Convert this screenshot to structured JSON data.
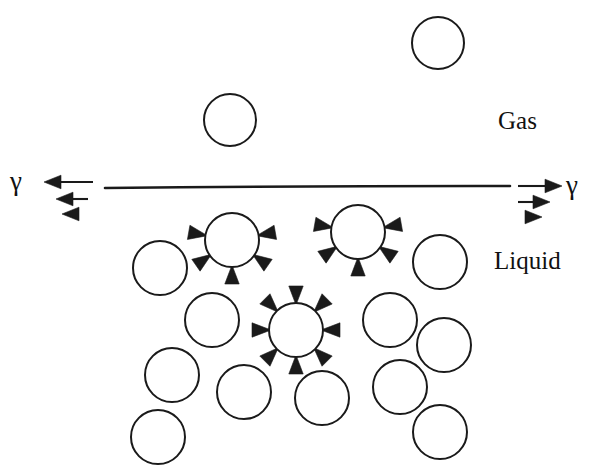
{
  "figure": {
    "kind": "surface-tension-diagram",
    "background_color": "#ffffff",
    "ink_color": "#1a1a1a",
    "width": 600,
    "height": 476
  },
  "labels": {
    "gas": "Gas",
    "liquid": "Liquid",
    "gamma_left": "γ",
    "gamma_right": "γ"
  },
  "chart_data": {
    "type": "diagram",
    "interface": {
      "label": "liquid-gas interface line",
      "x1": 105,
      "y1": 188,
      "x2": 510,
      "y2": 186,
      "stroke_width": 2.6
    },
    "phases": [
      {
        "name": "Gas",
        "region": "above interface",
        "label_x": 498,
        "label_y": 108
      },
      {
        "name": "Liquid",
        "region": "below interface",
        "label_x": 494,
        "label_y": 248
      }
    ],
    "tension_arrows": {
      "description": "Surface tension gamma acting outward along the interface at both ends",
      "left": {
        "symbol": "γ",
        "direction": "left",
        "count": 3,
        "arrows": [
          {
            "tail_x": 93,
            "tail_y": 182,
            "tip_x": 44,
            "tip_y": 182,
            "shaft": true
          },
          {
            "tail_x": 88,
            "tail_y": 199,
            "tip_x": 56,
            "tip_y": 199,
            "shaft": true
          },
          {
            "tail_x": 88,
            "tail_y": 214,
            "tip_x": 62,
            "tip_y": 214,
            "shaft": false
          }
        ]
      },
      "right": {
        "symbol": "γ",
        "direction": "right",
        "count": 3,
        "arrows": [
          {
            "tail_x": 518,
            "tail_y": 186,
            "tip_x": 562,
            "tip_y": 186,
            "shaft": true
          },
          {
            "tail_x": 518,
            "tail_y": 202,
            "tip_x": 550,
            "tip_y": 202,
            "shaft": true
          },
          {
            "tail_x": 516,
            "tail_y": 217,
            "tip_x": 542,
            "tip_y": 217,
            "shaft": false
          }
        ]
      }
    },
    "molecules": [
      {
        "id": "gas-1",
        "phase": "gas",
        "cx": 230,
        "cy": 120,
        "r": 26,
        "arrows": 0,
        "note": "free gas molecule, no net force shown"
      },
      {
        "id": "gas-2",
        "phase": "gas",
        "cx": 438,
        "cy": 43,
        "r": 26,
        "arrows": 0,
        "note": "free gas molecule, no net force shown"
      },
      {
        "id": "surface-1",
        "phase": "liquid",
        "cx": 232,
        "cy": 240,
        "r": 27,
        "arrows": 5,
        "arrow_angles_deg": [
          170,
          10,
          215,
          325,
          270
        ],
        "note": "surface molecule: unbalanced inward pull, no upward neighbours"
      },
      {
        "id": "surface-2",
        "phase": "liquid",
        "cx": 358,
        "cy": 232,
        "r": 27,
        "arrows": 5,
        "arrow_angles_deg": [
          170,
          10,
          215,
          325,
          270
        ],
        "note": "surface molecule: unbalanced inward pull, no upward neighbours"
      },
      {
        "id": "bulk-1",
        "phase": "liquid",
        "cx": 296,
        "cy": 330,
        "r": 27,
        "arrows": 8,
        "arrow_angles_deg": [
          0,
          45,
          90,
          135,
          180,
          225,
          270,
          315
        ],
        "note": "bulk molecule: forces balanced in all directions"
      },
      {
        "id": "liq-1",
        "phase": "liquid",
        "cx": 160,
        "cy": 268,
        "r": 27,
        "arrows": 0
      },
      {
        "id": "liq-2",
        "phase": "liquid",
        "cx": 440,
        "cy": 262,
        "r": 27,
        "arrows": 0
      },
      {
        "id": "liq-3",
        "phase": "liquid",
        "cx": 212,
        "cy": 320,
        "r": 27,
        "arrows": 0
      },
      {
        "id": "liq-4",
        "phase": "liquid",
        "cx": 390,
        "cy": 320,
        "r": 27,
        "arrows": 0
      },
      {
        "id": "liq-5",
        "phase": "liquid",
        "cx": 444,
        "cy": 345,
        "r": 27,
        "arrows": 0
      },
      {
        "id": "liq-6",
        "phase": "liquid",
        "cx": 172,
        "cy": 375,
        "r": 27,
        "arrows": 0
      },
      {
        "id": "liq-7",
        "phase": "liquid",
        "cx": 400,
        "cy": 387,
        "r": 27,
        "arrows": 0
      },
      {
        "id": "liq-8",
        "phase": "liquid",
        "cx": 244,
        "cy": 392,
        "r": 27,
        "arrows": 0
      },
      {
        "id": "liq-9",
        "phase": "liquid",
        "cx": 322,
        "cy": 398,
        "r": 27,
        "arrows": 0
      },
      {
        "id": "liq-10",
        "phase": "liquid",
        "cx": 158,
        "cy": 437,
        "r": 27,
        "arrows": 0
      },
      {
        "id": "liq-11",
        "phase": "liquid",
        "cx": 440,
        "cy": 432,
        "r": 27,
        "arrows": 0
      }
    ]
  }
}
